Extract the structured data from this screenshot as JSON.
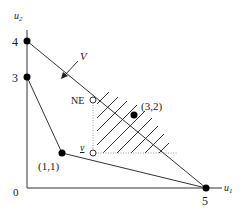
{
  "diagram": {
    "axes": {
      "x_label": "u",
      "x_label_sub": "1",
      "y_label": "u",
      "y_label_sub": "2",
      "origin_label": "0"
    },
    "tick_labels": {
      "y_4": "4",
      "y_3": "3",
      "x_5": "5"
    },
    "points": [
      {
        "label": "(1,1)",
        "u1": 1,
        "u2": 1
      },
      {
        "label": "(3,2)",
        "u1": 3,
        "u2": 2
      }
    ],
    "vertices": [
      {
        "u1": 0,
        "u2": 4
      },
      {
        "u1": 0,
        "u2": 3
      },
      {
        "u1": 1,
        "u2": 1
      },
      {
        "u1": 5,
        "u2": 0
      }
    ],
    "annotations": {
      "arrow_label": "V",
      "ne_label": "NE",
      "v_label": "v"
    },
    "colors": {
      "line": "#333333",
      "dot": "#000000",
      "dotted": "#999999"
    }
  }
}
